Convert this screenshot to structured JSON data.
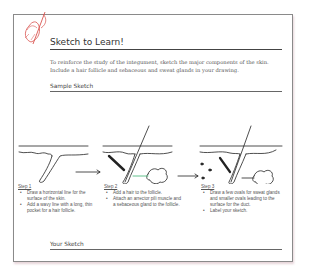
{
  "header": {
    "icon": "pencil-sketch-icon",
    "title": "Sketch to Learn!"
  },
  "intro": "To reinforce the study of the integument, sketch the major components of the skin. Include a hair follicle and sebaceous and sweat glands in your drawing.",
  "sample_heading": "Sample Sketch",
  "steps": [
    {
      "heading": "Step 1",
      "bullets": [
        "Draw a horizontal line for the surface of the skin.",
        "Add a wavy line with a long, thin pocket for a hair follicle."
      ]
    },
    {
      "heading": "Step 2",
      "bullets": [
        "Add a hair to the follicle.",
        "Attach an arrector pili muscle and a sebaceous gland to the follicle."
      ]
    },
    {
      "heading": "Step 3",
      "bullets": [
        "Draw a few ovals for sweat glands and smaller ovals leading to the surface for the duct.",
        "Label your sketch."
      ]
    }
  ],
  "your_heading": "Your Sketch",
  "colors": {
    "icon_red": "#d9534f",
    "duct_green": "#3cb371",
    "ink": "#222222"
  }
}
